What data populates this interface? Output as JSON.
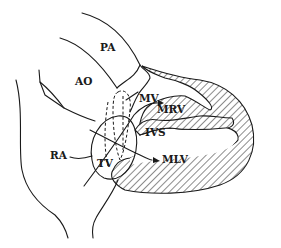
{
  "diagram": {
    "type": "anatomical-line-drawing",
    "colors": {
      "ink": "#1a1a1a",
      "background": "#ffffff"
    },
    "labels": {
      "pa": "PA",
      "ao": "AO",
      "mv": "MV",
      "mrv": "MRV",
      "ivs": "IVS",
      "ra": "RA",
      "tv": "TV",
      "mlv": "MLV"
    }
  }
}
